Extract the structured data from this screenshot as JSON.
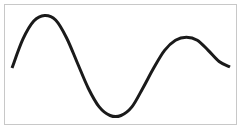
{
  "chart_data": {
    "type": "line",
    "title": "",
    "xlabel": "",
    "ylabel": "",
    "grid": false,
    "legend": "none",
    "line_color": "#1a1a1a",
    "frame_color": "#c8c8c8",
    "xlim": [
      0,
      1
    ],
    "ylim": [
      -1,
      1
    ],
    "series": [
      {
        "name": "wave",
        "x": [
          0.0,
          0.05,
          0.1,
          0.15,
          0.2,
          0.25,
          0.3,
          0.35,
          0.4,
          0.45,
          0.5,
          0.55,
          0.6,
          0.65,
          0.7,
          0.75,
          0.8,
          0.85,
          0.9,
          0.95,
          1.0
        ],
        "y": [
          -0.05,
          0.52,
          0.88,
          0.99,
          0.9,
          0.55,
          0.05,
          -0.45,
          -0.82,
          -0.99,
          -0.99,
          -0.82,
          -0.45,
          -0.05,
          0.3,
          0.5,
          0.56,
          0.5,
          0.3,
          0.08,
          -0.03
        ]
      }
    ]
  }
}
